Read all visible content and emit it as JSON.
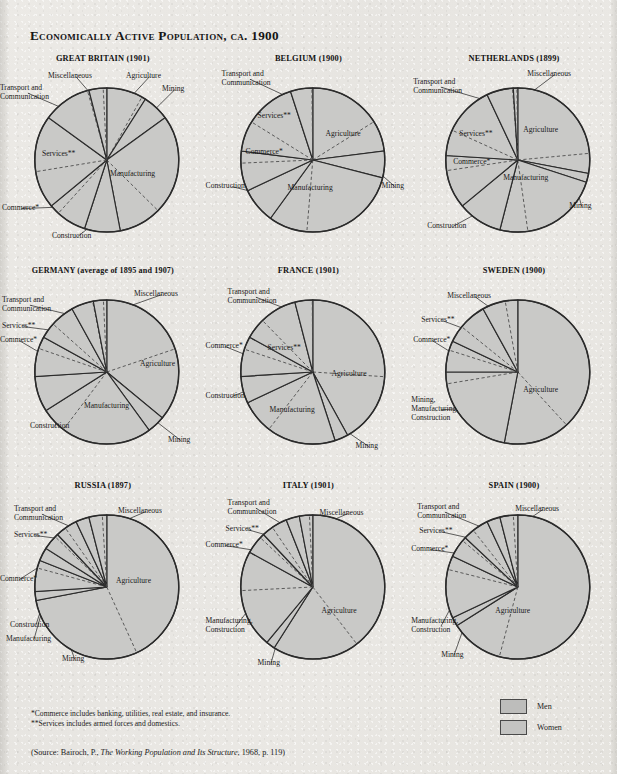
{
  "title": "Economically Active Population, ca. 1900",
  "colors": {
    "page_background": "#e9e8e4",
    "slice_fill": "#c9c9c7",
    "slice_stroke": "#2b2b2b",
    "gender_divider": "#4d4d4d",
    "text": "#1c1c1c"
  },
  "notes": {
    "commerce": "*Commerce includes banking, utilities, real estate, and insurance.",
    "services": "**Services includes armed forces and domestics."
  },
  "source": {
    "prefix": "(Source: Bairoch, P., ",
    "work": "The Working Population and Its Structure",
    "suffix": ", 1968, p. 119)"
  },
  "legend": {
    "men_label": "Men",
    "women_label": "Women"
  },
  "chart_data": [
    {
      "type": "pie",
      "title": "GREAT BRITAIN (1901)",
      "categories": [
        "Agriculture",
        "Mining",
        "Manufacturing",
        "Construction",
        "Commerce*",
        "Services**",
        "Transport and\nCommunication",
        "Miscellaneous"
      ],
      "values": [
        9,
        6,
        32,
        8,
        9,
        21,
        11,
        4
      ],
      "women_share": [
        0.1,
        0.02,
        0.3,
        0.01,
        0.25,
        0.6,
        0.03,
        0.2
      ],
      "ylabel": "",
      "xlabel": ""
    },
    {
      "type": "pie",
      "title": "BELGIUM (1900)",
      "categories": [
        "Agriculture",
        "Mining",
        "Manufacturing",
        "Construction",
        "Commerce*",
        "Services**",
        "Transport and\nCommunication"
      ],
      "values": [
        23,
        6,
        31,
        8,
        9,
        18,
        5
      ],
      "women_share": [
        0.3,
        0.02,
        0.28,
        0.01,
        0.3,
        0.62,
        0.04
      ],
      "ylabel": "",
      "xlabel": ""
    },
    {
      "type": "pie",
      "title": "NETHERLANDS (1899)",
      "categories": [
        "Agriculture",
        "Mining",
        "Manufacturing",
        "Construction",
        "Commerce*",
        "Services**",
        "Transport and\nCommunication",
        "Miscellaneous"
      ],
      "values": [
        28,
        2,
        24,
        10,
        12,
        17,
        6,
        1
      ],
      "women_share": [
        0.16,
        0.01,
        0.26,
        0.01,
        0.28,
        0.66,
        0.03,
        0.2
      ],
      "ylabel": "",
      "xlabel": ""
    },
    {
      "type": "pie",
      "title": "GERMANY (average of 1895 and 1907)",
      "categories": [
        "Agriculture",
        "Mining",
        "Manufacturing",
        "Construction",
        "Commerce*",
        "Services**",
        "Transport and\nCommunication",
        "Miscellaneous"
      ],
      "values": [
        36,
        4,
        26,
        8,
        9,
        9,
        5,
        3
      ],
      "women_share": [
        0.45,
        0.01,
        0.22,
        0.01,
        0.3,
        0.6,
        0.03,
        0.25
      ],
      "ylabel": "",
      "xlabel": ""
    },
    {
      "type": "pie",
      "title": "FRANCE (1901)",
      "categories": [
        "Agriculture",
        "Mining",
        "Manufacturing",
        "Construction",
        "Commerce*",
        "Services**",
        "Transport and\nCommunication"
      ],
      "values": [
        42,
        3,
        23,
        6,
        9,
        13,
        4
      ],
      "women_share": [
        0.38,
        0.01,
        0.33,
        0.01,
        0.32,
        0.64,
        0.03
      ],
      "ylabel": "",
      "xlabel": ""
    },
    {
      "type": "pie",
      "title": "SWEDEN (1900)",
      "categories": [
        "Agriculture",
        "Mining,\nManufacturing,\nConstruction",
        "Commerce*",
        "Services**",
        "Miscellaneous"
      ],
      "values": [
        53,
        22,
        7,
        10,
        8
      ],
      "women_share": [
        0.28,
        0.12,
        0.3,
        0.62,
        0.35
      ],
      "ylabel": "",
      "xlabel": ""
    },
    {
      "type": "pie",
      "title": "RUSSIA (1897)",
      "categories": [
        "Agriculture",
        "Mining",
        "Manufacturing",
        "Construction",
        "Commerce*",
        "Services**",
        "Transport and\nCommunication",
        "Miscellaneous"
      ],
      "values": [
        72,
        2,
        7,
        3,
        4,
        5,
        3,
        4
      ],
      "women_share": [
        0.4,
        0.02,
        0.25,
        0.01,
        0.18,
        0.55,
        0.02,
        0.25
      ],
      "ylabel": "",
      "xlabel": ""
    },
    {
      "type": "pie",
      "title": "ITALY (1901)",
      "categories": [
        "Agriculture",
        "Mining",
        "Manufacturing,\nConstruction",
        "Commerce*",
        "Services**",
        "Transport and\nCommunication",
        "Miscellaneous"
      ],
      "values": [
        59,
        2,
        22,
        5,
        6,
        3,
        3
      ],
      "women_share": [
        0.33,
        0.02,
        0.4,
        0.2,
        0.58,
        0.02,
        0.25
      ],
      "ylabel": "",
      "xlabel": ""
    },
    {
      "type": "pie",
      "title": "SPAIN (1900)",
      "categories": [
        "Agriculture",
        "Mining",
        "Manufacturing,\nConstruction",
        "Commerce*",
        "Services**",
        "Transport and\nCommunication",
        "Miscellaneous"
      ],
      "values": [
        66,
        2,
        14,
        5,
        6,
        3,
        4
      ],
      "women_share": [
        0.18,
        0.02,
        0.22,
        0.18,
        0.6,
        0.02,
        0.25
      ],
      "ylabel": "",
      "xlabel": ""
    }
  ],
  "labels": {
    "great_britain": [
      {
        "text": "Agriculture",
        "x": 126,
        "y": 20,
        "align": "left"
      },
      {
        "text": "Mining",
        "x": 162,
        "y": 33,
        "align": "left"
      },
      {
        "text": "Manufacturing",
        "x": 110,
        "y": 118,
        "align": "left"
      },
      {
        "text": "Construction",
        "x": 52,
        "y": 180,
        "align": "left"
      },
      {
        "text": "Commerce*",
        "x": 2,
        "y": 152,
        "align": "left"
      },
      {
        "text": "Services**",
        "x": 42,
        "y": 98,
        "align": "left"
      },
      {
        "text": "Transport and\nCommunication",
        "x": 0,
        "y": 32,
        "align": "left"
      },
      {
        "text": "Miscellaneous",
        "x": 48,
        "y": 20,
        "align": "left"
      }
    ],
    "belgium": [
      {
        "text": "Agriculture",
        "x": 120,
        "y": 78,
        "align": "left"
      },
      {
        "text": "Mining",
        "x": 176,
        "y": 130,
        "align": "left"
      },
      {
        "text": "Manufacturing",
        "x": 82,
        "y": 132,
        "align": "left"
      },
      {
        "text": "Construction",
        "x": 0,
        "y": 130,
        "align": "left"
      },
      {
        "text": "Commerce*",
        "x": 40,
        "y": 96,
        "align": "left"
      },
      {
        "text": "Services**",
        "x": 52,
        "y": 60,
        "align": "left"
      },
      {
        "text": "Transport and\nCommunication",
        "x": 16,
        "y": 18,
        "align": "left"
      }
    ],
    "netherlands": [
      {
        "text": "Agriculture",
        "x": 112,
        "y": 74,
        "align": "left"
      },
      {
        "text": "Mining",
        "x": 158,
        "y": 150,
        "align": "left"
      },
      {
        "text": "Manufacturing",
        "x": 92,
        "y": 122,
        "align": "left"
      },
      {
        "text": "Construction",
        "x": 16,
        "y": 170,
        "align": "left"
      },
      {
        "text": "Commerce*",
        "x": 42,
        "y": 106,
        "align": "left"
      },
      {
        "text": "Services**",
        "x": 48,
        "y": 78,
        "align": "left"
      },
      {
        "text": "Transport and\nCommunication",
        "x": 2,
        "y": 26,
        "align": "left"
      },
      {
        "text": "Miscellaneous",
        "x": 116,
        "y": 18,
        "align": "left"
      }
    ],
    "germany": [
      {
        "text": "Agriculture",
        "x": 140,
        "y": 96,
        "align": "left"
      },
      {
        "text": "Mining",
        "x": 168,
        "y": 172,
        "align": "left"
      },
      {
        "text": "Manufacturing",
        "x": 84,
        "y": 138,
        "align": "left"
      },
      {
        "text": "Construction",
        "x": 30,
        "y": 158,
        "align": "left"
      },
      {
        "text": "Commerce*",
        "x": 0,
        "y": 72,
        "align": "left"
      },
      {
        "text": "Services**",
        "x": 2,
        "y": 58,
        "align": "left"
      },
      {
        "text": "Transport and\nCommunication",
        "x": 2,
        "y": 32,
        "align": "left"
      },
      {
        "text": "Miscellaneous",
        "x": 134,
        "y": 26,
        "align": "left"
      }
    ],
    "france": [
      {
        "text": "Agriculture",
        "x": 126,
        "y": 106,
        "align": "left"
      },
      {
        "text": "Mining",
        "x": 150,
        "y": 178,
        "align": "left"
      },
      {
        "text": "Manufacturing",
        "x": 64,
        "y": 142,
        "align": "left"
      },
      {
        "text": "Construction",
        "x": 0,
        "y": 128,
        "align": "left"
      },
      {
        "text": "Commerce*",
        "x": 0,
        "y": 78,
        "align": "left"
      },
      {
        "text": "Services**",
        "x": 62,
        "y": 80,
        "align": "left"
      },
      {
        "text": "Transport and\nCommunication",
        "x": 22,
        "y": 24,
        "align": "left"
      }
    ],
    "sweden": [
      {
        "text": "Agriculture",
        "x": 112,
        "y": 122,
        "align": "left"
      },
      {
        "text": "Mining,\nManufacturing,\nConstruction",
        "x": 0,
        "y": 132,
        "align": "left"
      },
      {
        "text": "Commerce*",
        "x": 2,
        "y": 72,
        "align": "left"
      },
      {
        "text": "Services**",
        "x": 10,
        "y": 52,
        "align": "left"
      },
      {
        "text": "Miscellaneous",
        "x": 36,
        "y": 28,
        "align": "left"
      }
    ],
    "russia": [
      {
        "text": "Agriculture",
        "x": 116,
        "y": 98,
        "align": "left"
      },
      {
        "text": "Mining",
        "x": 62,
        "y": 176,
        "align": "left"
      },
      {
        "text": "Manufacturing",
        "x": 6,
        "y": 156,
        "align": "left"
      },
      {
        "text": "Construction",
        "x": 10,
        "y": 142,
        "align": "left"
      },
      {
        "text": "Commerce*",
        "x": 0,
        "y": 96,
        "align": "left"
      },
      {
        "text": "Services**",
        "x": 14,
        "y": 52,
        "align": "left"
      },
      {
        "text": "Transport and\nCommunication",
        "x": 14,
        "y": 26,
        "align": "left"
      },
      {
        "text": "Miscellaneous",
        "x": 118,
        "y": 28,
        "align": "left"
      }
    ],
    "italy": [
      {
        "text": "Agriculture",
        "x": 116,
        "y": 128,
        "align": "left"
      },
      {
        "text": "Mining",
        "x": 52,
        "y": 180,
        "align": "left"
      },
      {
        "text": "Manufacturing,\nConstruction",
        "x": 0,
        "y": 138,
        "align": "left"
      },
      {
        "text": "Commerce*",
        "x": 0,
        "y": 62,
        "align": "left"
      },
      {
        "text": "Services**",
        "x": 20,
        "y": 46,
        "align": "left"
      },
      {
        "text": "Transport and\nCommunication",
        "x": 22,
        "y": 20,
        "align": "left"
      },
      {
        "text": "Miscellaneous",
        "x": 114,
        "y": 30,
        "align": "left"
      }
    ],
    "spain": [
      {
        "text": "Agriculture",
        "x": 84,
        "y": 128,
        "align": "left"
      },
      {
        "text": "Mining",
        "x": 30,
        "y": 172,
        "align": "left"
      },
      {
        "text": "Manufacturing,\nConstruction",
        "x": 0,
        "y": 138,
        "align": "left"
      },
      {
        "text": "Commerce*",
        "x": 0,
        "y": 66,
        "align": "left"
      },
      {
        "text": "Services**",
        "x": 8,
        "y": 48,
        "align": "left"
      },
      {
        "text": "Transport and\nCommunication",
        "x": 6,
        "y": 24,
        "align": "left"
      },
      {
        "text": "Miscellaneous",
        "x": 104,
        "y": 26,
        "align": "left"
      }
    ]
  }
}
